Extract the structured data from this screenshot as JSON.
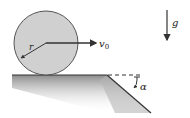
{
  "diagram": {
    "labels": {
      "radius": "r",
      "velocity": "v",
      "velocity_sub": "0",
      "gravity": "g",
      "angle": "α"
    },
    "colors": {
      "disk_fill": "#cfcfcf",
      "disk_stroke": "#555555",
      "line": "#333333",
      "ground_shade": "#9a9a9a"
    }
  }
}
